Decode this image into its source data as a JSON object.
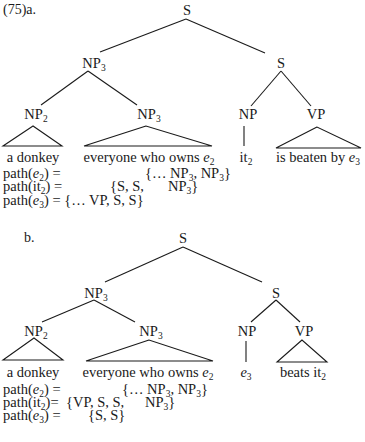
{
  "example_number": "(75)",
  "part_a": {
    "label": "a.",
    "tree": {
      "root": "S",
      "np3_top": {
        "cat": "NP",
        "index": "3"
      },
      "s_right": "S",
      "np2": {
        "cat": "NP",
        "index": "2"
      },
      "np3_bottom": {
        "cat": "NP",
        "index": "3"
      },
      "np": "NP",
      "vp": "VP"
    },
    "leaves": {
      "np2": "a donkey",
      "np3_text": "everyone who owns ",
      "np3_var": "e",
      "np3_idx": "2",
      "np_word": "it",
      "np_idx": "2",
      "vp_text": "is beaten by ",
      "vp_var": "e",
      "vp_idx": "3"
    },
    "paths": [
      {
        "lhs_fn": "path(",
        "lhs_var": "e",
        "lhs_idx": "2",
        "lhs_close": ") =",
        "rhs_a": "{… NP",
        "rhs_a_idx": "3",
        "rhs_b": ", NP",
        "rhs_b_idx": "3",
        "rhs_end": "}"
      },
      {
        "lhs_fn": "path(",
        "lhs_var": "it",
        "lhs_idx": "2",
        "lhs_close": ") =",
        "rhs_a": "{S, S,",
        "rhs_b": "NP",
        "rhs_b_idx": "3",
        "rhs_end": "}"
      },
      {
        "lhs_fn": "path(",
        "lhs_var": "e",
        "lhs_idx": "3",
        "lhs_close": ") =",
        "rhs_a": "{… VP, S, S}"
      }
    ]
  },
  "part_b": {
    "label": "b.",
    "tree": {
      "root": "S",
      "np3_top": {
        "cat": "NP",
        "index": "3"
      },
      "s_right": "S",
      "np2": {
        "cat": "NP",
        "index": "2"
      },
      "np3_bottom": {
        "cat": "NP",
        "index": "3"
      },
      "np": "NP",
      "vp": "VP"
    },
    "leaves": {
      "np2": "a donkey",
      "np3_text": "everyone who owns ",
      "np3_var": "e",
      "np3_idx": "2",
      "np_var": "e",
      "np_idx": "3",
      "vp_text": "beats it",
      "vp_idx": "2"
    },
    "paths": [
      {
        "lhs_fn": "path(",
        "lhs_var": "e",
        "lhs_idx": "2",
        "lhs_close": ") =",
        "rhs_a": "{… NP",
        "rhs_a_idx": "3",
        "rhs_b": ", NP",
        "rhs_b_idx": "3",
        "rhs_end": "}"
      },
      {
        "lhs_fn": "path(",
        "lhs_var": "it",
        "lhs_idx": "2",
        "lhs_close": ")=",
        "rhs_a": "{VP, S, S,",
        "rhs_b": "NP",
        "rhs_b_idx": "3",
        "rhs_end": "}"
      },
      {
        "lhs_fn": "path(",
        "lhs_var": "e",
        "lhs_idx": "3",
        "lhs_close": ") =",
        "rhs_a": "{S, S}"
      }
    ]
  }
}
